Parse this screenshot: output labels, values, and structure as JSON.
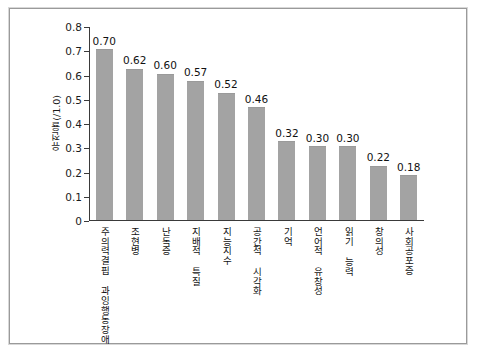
{
  "chart_data": {
    "type": "bar",
    "title": "",
    "xlabel": "",
    "ylabel": "유전율(/1.0)",
    "ylim": [
      0,
      0.8
    ],
    "ytick_labels": [
      "0.8",
      "0.7",
      "0.6",
      "0.5",
      "0.4",
      "0.3",
      "0.2",
      "0.1",
      "0"
    ],
    "ytick_values": [
      0.8,
      0.7,
      0.6,
      0.5,
      0.4,
      0.3,
      0.2,
      0.1,
      0
    ],
    "grid": false,
    "legend": "none",
    "bar_color": "#a3a3a3",
    "axis_color": "#3a3a3a",
    "categories": [
      "주의력결핍 과잉행동장애",
      "조현병",
      "난독증",
      "지배적 특질",
      "지능지수",
      "공간적 시각화",
      "기억",
      "언어적 유창성",
      "읽기 능력",
      "창의성",
      "사회공포증"
    ],
    "values": [
      0.7,
      0.62,
      0.6,
      0.57,
      0.52,
      0.46,
      0.32,
      0.3,
      0.3,
      0.22,
      0.18
    ],
    "value_labels": [
      "0.70",
      "0.62",
      "0.60",
      "0.57",
      "0.52",
      "0.46",
      "0.32",
      "0.30",
      "0.30",
      "0.22",
      "0.18"
    ]
  }
}
